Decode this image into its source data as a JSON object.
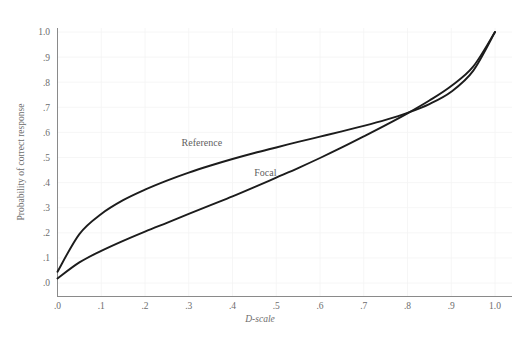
{
  "chart_data": {
    "type": "line",
    "title": "",
    "xlabel": "D-scale",
    "ylabel": "Probability of correct response",
    "xlim": [
      0,
      1
    ],
    "ylim": [
      0,
      1
    ],
    "grid": true,
    "legend_position": "inline-annotation",
    "xticks": [
      0,
      0.1,
      0.2,
      0.3,
      0.4,
      0.5,
      0.6,
      0.7,
      0.8,
      0.9,
      1.0
    ],
    "xticklabels": [
      ".0",
      ".1",
      ".2",
      ".3",
      ".4",
      ".5",
      ".6",
      ".7",
      ".8",
      ".9",
      "1.0"
    ],
    "yticks": [
      0,
      0.1,
      0.2,
      0.3,
      0.4,
      0.5,
      0.6,
      0.7,
      0.8,
      0.9,
      1.0
    ],
    "yticklabels": [
      ".0",
      ".1",
      ".2",
      ".3",
      ".4",
      ".5",
      ".6",
      ".7",
      ".8",
      ".9",
      "1.0"
    ],
    "x": [
      0.0,
      0.05,
      0.1,
      0.15,
      0.2,
      0.25,
      0.3,
      0.35,
      0.4,
      0.45,
      0.5,
      0.55,
      0.6,
      0.65,
      0.7,
      0.75,
      0.8,
      0.85,
      0.9,
      0.95,
      1.0
    ],
    "series": [
      {
        "name": "Reference",
        "label": "Reference",
        "color": "#1c1c1c",
        "values": [
          0.045,
          0.195,
          0.275,
          0.33,
          0.372,
          0.408,
          0.44,
          0.468,
          0.494,
          0.518,
          0.54,
          0.562,
          0.583,
          0.604,
          0.626,
          0.65,
          0.678,
          0.713,
          0.762,
          0.845,
          1.0
        ],
        "label_x": 0.33,
        "label_y": 0.545
      },
      {
        "name": "Focal",
        "label": "Focal",
        "color": "#1c1c1c",
        "values": [
          0.018,
          0.082,
          0.128,
          0.168,
          0.205,
          0.24,
          0.275,
          0.31,
          0.345,
          0.382,
          0.42,
          0.458,
          0.498,
          0.54,
          0.584,
          0.629,
          0.676,
          0.727,
          0.785,
          0.862,
          1.0
        ],
        "label_x": 0.475,
        "label_y": 0.425
      }
    ],
    "annotations": [
      {
        "text": "Reference",
        "x": 0.33,
        "y": 0.545
      },
      {
        "text": "Focal",
        "x": 0.475,
        "y": 0.425
      }
    ]
  }
}
